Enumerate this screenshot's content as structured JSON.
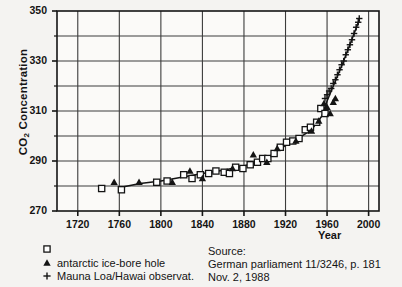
{
  "chart_data": {
    "type": "scatter",
    "title": "",
    "xlabel": "Year",
    "ylabel": "CO2  Concentration",
    "ylabel_main": "CO",
    "ylabel_sub": "2",
    "ylabel_rest": "  Concentration",
    "xlim": [
      1700,
      2010
    ],
    "ylim": [
      270,
      350
    ],
    "xticks": [
      1720,
      1760,
      1800,
      1840,
      1880,
      1920,
      1960,
      2000
    ],
    "yticks": [
      270,
      290,
      310,
      330,
      350
    ],
    "yminorticks": [
      280,
      300,
      320,
      340
    ],
    "grid": true,
    "legend_position": "below-left",
    "series": [
      {
        "name": "antarctic ice-bore hole",
        "marker": "open-square",
        "color": "#141414",
        "points": [
          [
            1743,
            279.0
          ],
          [
            1762,
            278.5
          ],
          [
            1796,
            281.5
          ],
          [
            1806,
            282.0
          ],
          [
            1822,
            284.5
          ],
          [
            1830,
            283.0
          ],
          [
            1838,
            284.5
          ],
          [
            1846,
            285.0
          ],
          [
            1853,
            286.0
          ],
          [
            1861,
            285.5
          ],
          [
            1866,
            285.0
          ],
          [
            1872,
            287.5
          ],
          [
            1879,
            287.0
          ],
          [
            1886,
            288.5
          ],
          [
            1893,
            289.5
          ],
          [
            1898,
            291.0
          ],
          [
            1903,
            291.0
          ],
          [
            1909,
            293.0
          ],
          [
            1915,
            295.5
          ],
          [
            1921,
            297.5
          ],
          [
            1927,
            298.0
          ],
          [
            1933,
            299.0
          ],
          [
            1939,
            302.5
          ],
          [
            1944,
            303.5
          ],
          [
            1950,
            305.5
          ],
          [
            1954,
            311.0
          ],
          [
            1958,
            309.0
          ]
        ]
      },
      {
        "name": "antarctic ice-bore hole",
        "marker": "filled-triangle",
        "color": "#141414",
        "points": [
          [
            1755,
            281.5
          ],
          [
            1779,
            281.5
          ],
          [
            1811,
            281.5
          ],
          [
            1828,
            286.0
          ],
          [
            1840,
            283.0
          ],
          [
            1869,
            287.0
          ],
          [
            1889,
            292.5
          ],
          [
            1902,
            289.5
          ],
          [
            1912,
            295.0
          ],
          [
            1930,
            298.0
          ],
          [
            1945,
            302.0
          ],
          [
            1952,
            306.0
          ],
          [
            1957,
            313.0
          ],
          [
            1960,
            311.5
          ],
          [
            1963,
            309.0
          ],
          [
            1966,
            313.5
          ],
          [
            1968,
            315.0
          ]
        ]
      },
      {
        "name": "Mauna Loa/Hawai observat.",
        "marker": "plus",
        "color": "#141414",
        "points": [
          [
            1958,
            315.0
          ],
          [
            1960,
            316.5
          ],
          [
            1962,
            318.0
          ],
          [
            1964,
            319.0
          ],
          [
            1966,
            321.0
          ],
          [
            1968,
            322.5
          ],
          [
            1970,
            324.5
          ],
          [
            1972,
            326.5
          ],
          [
            1974,
            328.5
          ],
          [
            1976,
            330.0
          ],
          [
            1978,
            332.5
          ],
          [
            1980,
            334.5
          ],
          [
            1982,
            336.5
          ],
          [
            1984,
            338.5
          ],
          [
            1986,
            341.0
          ],
          [
            1988,
            343.5
          ],
          [
            1990,
            345.5
          ],
          [
            1991,
            347.0
          ]
        ]
      }
    ],
    "trendline": [
      [
        1762,
        279.5
      ],
      [
        1780,
        281.0
      ],
      [
        1800,
        282.0
      ],
      [
        1820,
        283.5
      ],
      [
        1840,
        285.0
      ],
      [
        1860,
        286.3
      ],
      [
        1880,
        288.0
      ],
      [
        1900,
        290.5
      ],
      [
        1915,
        295.0
      ],
      [
        1930,
        298.5
      ],
      [
        1945,
        302.5
      ],
      [
        1955,
        308.0
      ],
      [
        1960,
        314.0
      ],
      [
        1968,
        322.0
      ],
      [
        1975,
        329.0
      ],
      [
        1982,
        336.5
      ],
      [
        1991,
        346.5
      ]
    ]
  },
  "legend": {
    "items": [
      {
        "marker": "open-square",
        "label": ""
      },
      {
        "marker": "filled-triangle",
        "label": "antarctic ice-bore hole"
      },
      {
        "marker": "plus",
        "label": "Mauna Loa/Hawai observat."
      }
    ]
  },
  "source": {
    "line1": "Source:",
    "line2": "German parliament 11/3246, p. 181",
    "line3": "Nov. 2, 1988"
  }
}
